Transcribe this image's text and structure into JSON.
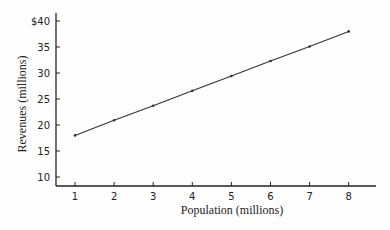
{
  "chart_data": {
    "type": "line",
    "title": "",
    "xlabel": "Population (millions)",
    "ylabel": "Revenues (millions)",
    "x": [
      1,
      2,
      3,
      4,
      5,
      6,
      7,
      8
    ],
    "series": [
      {
        "name": "Revenues",
        "values": [
          18,
          20.9,
          23.7,
          26.6,
          29.4,
          32.3,
          35.1,
          38
        ]
      }
    ],
    "x_ticks": [
      "1",
      "2",
      "3",
      "4",
      "5",
      "6",
      "7",
      "8"
    ],
    "y_ticks": [
      "10",
      "15",
      "20",
      "25",
      "30",
      "35",
      "$40"
    ],
    "xlim": [
      0.5,
      8.8
    ],
    "ylim": [
      8.3,
      42
    ],
    "grid": false,
    "legend": "none",
    "colors": {
      "line": "#333333",
      "axis": "#222222"
    }
  }
}
